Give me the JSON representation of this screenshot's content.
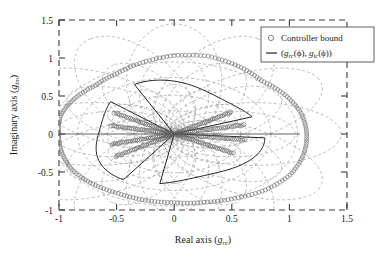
{
  "figure": {
    "name": "complex-plane-controller-bound",
    "background": "#ffffff",
    "width": 387,
    "height": 255
  },
  "axes": {
    "xlabel_main": "Real axis (",
    "xlabel_var": "g",
    "xlabel_sub": "re",
    "xlabel_close": ")",
    "ylabel_main": "Imaginary axis (",
    "ylabel_var": "g",
    "ylabel_sub": "im",
    "ylabel_close": ")",
    "x_ticks": [
      "-1",
      "-0.5",
      "0",
      "0.5",
      "1",
      "1.5"
    ],
    "y_ticks": [
      "1.5",
      "1",
      "0.5",
      "0",
      "-0.5",
      "-1"
    ],
    "x_tick_values": [
      -1,
      -0.5,
      0,
      0.5,
      1,
      1.5
    ],
    "y_tick_values": [
      1.5,
      1,
      0.5,
      0,
      -0.5,
      -1
    ],
    "xlim": [
      -1,
      1.5
    ],
    "ylim": [
      -1,
      1.5
    ],
    "box_style": "dashed",
    "grid": false
  },
  "legend": {
    "position": "top-right",
    "entries": [
      {
        "marker": "open-circle",
        "label": "Controller bound"
      },
      {
        "marker": "solid-line",
        "label_open": "(",
        "label_g1": "g",
        "label_sub1": "rc",
        "label_phi1": "(ϕ)",
        "label_comma": ", ",
        "label_g2": "g",
        "label_sub2": "ic",
        "label_phi2": "(ϕ)",
        "label_close": ")",
        "label_plain": "(g_rc(ϕ), g_ic(ϕ))"
      }
    ]
  },
  "colors": {
    "marker_stroke": "#5f5f5f",
    "petal_stroke": "#242424",
    "rosette_stroke": "#9a9a9a",
    "axis_stroke": "#3a3a3a",
    "text": "#1a1a1a",
    "background": "#ffffff"
  },
  "chart_data": {
    "type": "scatter",
    "title": "",
    "xlabel": "Real axis (g_re)",
    "ylabel": "Imaginary axis (g_im)",
    "xlim": [
      -1,
      1.5
    ],
    "ylim": [
      -1,
      1.5
    ],
    "grid": false,
    "legend_position": "upper right",
    "series": [
      {
        "name": "Controller bound",
        "style": "open-circle markers",
        "description": "Outer closed bound curve in the complex plane plus dense radial marker rays converging at the origin",
        "outer_bound_polar_deg": [
          0,
          15,
          30,
          45,
          60,
          75,
          90,
          105,
          120,
          135,
          150,
          165,
          180,
          195,
          210,
          225,
          240,
          255,
          270,
          285,
          300,
          315,
          330,
          345
        ],
        "outer_bound_radius": [
          1.15,
          1.14,
          1.11,
          1.07,
          1.11,
          1.14,
          1.11,
          1.05,
          0.99,
          0.97,
          1.0,
          1.02,
          1.0,
          1.01,
          1.02,
          1.0,
          0.97,
          0.97,
          0.97,
          1.0,
          1.05,
          1.12,
          1.16,
          1.16
        ],
        "outer_bound_x": [
          1.15,
          1.1,
          0.96,
          0.76,
          0.56,
          0.3,
          0.0,
          -0.27,
          -0.5,
          -0.69,
          -0.87,
          -0.99,
          -1.0,
          -0.98,
          -0.88,
          -0.71,
          -0.49,
          -0.25,
          0.0,
          0.26,
          0.53,
          0.79,
          1.0,
          1.12
        ],
        "outer_bound_y": [
          0.0,
          0.3,
          0.56,
          0.76,
          0.96,
          1.1,
          1.11,
          1.01,
          0.86,
          0.69,
          0.5,
          0.26,
          0.0,
          -0.26,
          -0.51,
          -0.71,
          -0.84,
          -0.94,
          -0.97,
          -0.97,
          -0.91,
          -0.79,
          -0.58,
          -0.3
        ],
        "rays_angles_deg": [
          12,
          32,
          150,
          168,
          195,
          212,
          332,
          352
        ],
        "rays_radius_max": [
          0.62,
          0.58,
          0.6,
          0.56,
          0.56,
          0.6,
          0.58,
          0.62
        ]
      },
      {
        "name": "(g_rc(ϕ), g_ic(ϕ))",
        "style": "solid line",
        "description": "Three-lobed petal curve (controller nominal locus) centred at the origin with radii near 0.7",
        "petal_count": 3,
        "petal_radius": 0.72,
        "petal_start_angles_deg": [
          20,
          140,
          260
        ]
      },
      {
        "name": "template ellipses",
        "style": "grey dashed",
        "description": "Rosette of overlapping dashed ellipses (uncertainty templates) spanning radius 0.25 to 1.05",
        "ellipse_count": 12,
        "ellipse_semi_major": 0.55,
        "ellipse_semi_minor": 0.3,
        "ellipse_center_radius": 0.5
      }
    ]
  }
}
